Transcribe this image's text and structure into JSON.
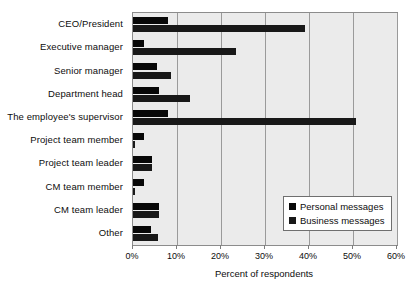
{
  "chart_data": {
    "type": "bar",
    "orientation": "horizontal",
    "title": "",
    "xlabel": "Percent of respondents",
    "ylabel": "",
    "xlim": [
      0,
      60
    ],
    "xticks": [
      "0%",
      "10%",
      "20%",
      "30%",
      "40%",
      "50%",
      "60%"
    ],
    "xtick_values": [
      0,
      10,
      20,
      30,
      40,
      50,
      60
    ],
    "grid": true,
    "legend_position": "lower-right",
    "categories": [
      "CEO/President",
      "Executive manager",
      "Senior manager",
      "Department head",
      "The employee's supervisor",
      "Project team member",
      "Project team leader",
      "CM team member",
      "CM team leader",
      "Other"
    ],
    "series": [
      {
        "name": "Personal messages",
        "color": "#080808",
        "values": [
          8.0,
          2.5,
          5.5,
          6.0,
          8.0,
          2.5,
          4.3,
          2.5,
          6.0,
          4.0
        ]
      },
      {
        "name": "Business messages",
        "color": "#181818",
        "values": [
          39.0,
          23.5,
          8.6,
          13.0,
          50.7,
          0.5,
          4.3,
          0.5,
          6.0,
          5.7
        ]
      }
    ]
  },
  "legend": {
    "items": [
      {
        "label": "Personal messages",
        "color": "#080808"
      },
      {
        "label": "Business messages",
        "color": "#181818"
      }
    ]
  }
}
